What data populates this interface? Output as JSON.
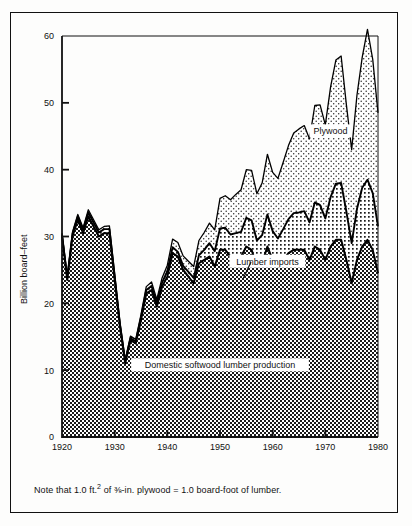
{
  "figure": {
    "note": "Note that 1.0 ft.² of ⅛-in. plywood = 1.0 board-foot of lumber.",
    "note_prefix": "Note that 1.0 ft.",
    "note_sup": "2",
    "note_suffix": " of ⅜-in. plywood = 1.0 board-foot of lumber."
  },
  "chart_data": {
    "type": "area",
    "stacked": true,
    "title": "",
    "subtitle": "",
    "xlabel": "",
    "ylabel": "Billion board–feet",
    "xlim": [
      1920,
      1980
    ],
    "ylim": [
      0,
      60
    ],
    "grid": false,
    "legend_position": "inline-annotations",
    "xticks": [
      1920,
      1930,
      1940,
      1950,
      1960,
      1970,
      1980
    ],
    "yticks": [
      0,
      10,
      20,
      30,
      40,
      50,
      60
    ],
    "xticklabels": [
      "1920",
      "1930",
      "1940",
      "1950",
      "1960",
      "1970",
      "1980"
    ],
    "yticklabels": [
      "0",
      "10",
      "20",
      "30",
      "40",
      "50",
      "60"
    ],
    "note": "Note that 1.0 ft.2 of 3/8-in. plywood = 1.0 board-foot of lumber.",
    "annotations": [
      {
        "text": "Plywood",
        "x": 1971,
        "y": 45.5
      },
      {
        "text": "Lumber imports",
        "x": 1959,
        "y": 26.0
      },
      {
        "text": "Domestic softwood lumber production",
        "x": 1950,
        "y": 10.5
      }
    ],
    "x": [
      1920,
      1921,
      1922,
      1923,
      1924,
      1925,
      1926,
      1927,
      1928,
      1929,
      1930,
      1931,
      1932,
      1933,
      1934,
      1935,
      1936,
      1937,
      1938,
      1939,
      1940,
      1941,
      1942,
      1943,
      1944,
      1945,
      1946,
      1947,
      1948,
      1949,
      1950,
      1951,
      1952,
      1953,
      1954,
      1955,
      1956,
      1957,
      1958,
      1959,
      1960,
      1961,
      1962,
      1963,
      1964,
      1965,
      1966,
      1967,
      1968,
      1969,
      1970,
      1971,
      1972,
      1973,
      1974,
      1975,
      1976,
      1977,
      1978,
      1979,
      1980
    ],
    "series": [
      {
        "name": "Domestic softwood lumber production",
        "pattern": "dense-checkerboard",
        "color": "#6b6b6b",
        "values": [
          30.0,
          23.5,
          30.0,
          32.5,
          30.5,
          33.0,
          31.5,
          30.0,
          30.5,
          30.5,
          23.5,
          16.5,
          11.0,
          14.5,
          14.0,
          17.5,
          21.5,
          22.0,
          19.5,
          22.5,
          24.0,
          27.5,
          27.0,
          25.0,
          24.0,
          23.0,
          26.0,
          26.5,
          27.0,
          25.5,
          28.0,
          28.0,
          27.0,
          27.0,
          27.0,
          28.5,
          28.0,
          25.5,
          26.0,
          28.5,
          26.5,
          25.5,
          26.5,
          27.5,
          28.0,
          28.0,
          28.0,
          26.5,
          28.5,
          28.0,
          26.5,
          28.5,
          29.5,
          29.5,
          26.5,
          23.0,
          26.5,
          28.5,
          29.5,
          28.0,
          24.5
        ]
      },
      {
        "name": "Lumber imports",
        "pattern": "medium-dots",
        "color": "#9a9a9a",
        "values": [
          0.3,
          0.3,
          0.4,
          0.5,
          0.5,
          0.6,
          0.6,
          0.6,
          0.6,
          0.6,
          0.5,
          0.4,
          0.3,
          0.3,
          0.3,
          0.4,
          0.5,
          0.6,
          0.5,
          0.6,
          0.8,
          0.9,
          0.7,
          0.6,
          0.7,
          0.8,
          1.2,
          1.5,
          2.0,
          2.3,
          3.2,
          3.3,
          3.3,
          3.5,
          3.7,
          4.3,
          4.4,
          3.9,
          4.2,
          4.8,
          4.3,
          4.2,
          4.6,
          5.1,
          5.5,
          5.6,
          5.8,
          5.6,
          6.6,
          6.7,
          6.2,
          7.4,
          8.4,
          8.5,
          7.2,
          6.0,
          7.6,
          8.8,
          9.0,
          8.5,
          7.0
        ]
      },
      {
        "name": "Plywood",
        "pattern": "light-dots",
        "color": "#cfcfcf",
        "values": [
          0.2,
          0.2,
          0.3,
          0.3,
          0.3,
          0.4,
          0.4,
          0.4,
          0.4,
          0.5,
          0.4,
          0.3,
          0.2,
          0.3,
          0.3,
          0.4,
          0.5,
          0.6,
          0.6,
          0.7,
          0.9,
          1.2,
          1.4,
          1.5,
          1.6,
          1.7,
          2.2,
          2.6,
          3.0,
          3.2,
          4.5,
          4.8,
          5.2,
          5.8,
          6.3,
          7.2,
          7.5,
          7.0,
          7.8,
          9.0,
          8.8,
          9.0,
          10.0,
          11.0,
          12.0,
          12.5,
          12.8,
          12.5,
          14.5,
          15.0,
          14.0,
          16.5,
          18.5,
          19.0,
          16.0,
          14.0,
          17.0,
          19.5,
          22.5,
          20.0,
          17.0
        ]
      }
    ],
    "stack_totals_note": "Top band boundary peaks at about 62 in 1978"
  }
}
